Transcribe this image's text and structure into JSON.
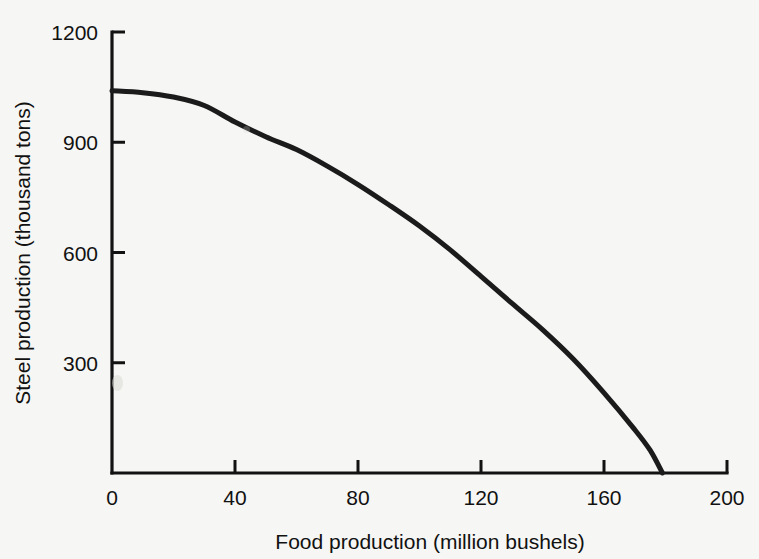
{
  "chart_data": {
    "type": "line",
    "title": "",
    "subtitle": "",
    "xlabel": "Food production (million bushels)",
    "ylabel": "Steel production (thousand tons)",
    "xlim": [
      0,
      200
    ],
    "ylim": [
      0,
      1200
    ],
    "xticks": [
      0,
      40,
      80,
      120,
      160,
      200
    ],
    "yticks": [
      0,
      300,
      600,
      900,
      1200
    ],
    "xtick_labels": [
      "0",
      "40",
      "80",
      "120",
      "160",
      "200"
    ],
    "ytick_labels": [
      "0",
      "300",
      "600",
      "900",
      "1200"
    ],
    "grid": false,
    "legend": "none",
    "series": [
      {
        "name": "Production possibilities frontier",
        "color": "#1b1b1b",
        "x": [
          0,
          10,
          20,
          30,
          40,
          50,
          60,
          70,
          80,
          90,
          100,
          110,
          120,
          130,
          140,
          150,
          160,
          170,
          175,
          179
        ],
        "y": [
          1040,
          1035,
          1023,
          1000,
          955,
          915,
          880,
          835,
          785,
          730,
          672,
          607,
          535,
          462,
          390,
          310,
          218,
          118,
          62,
          0
        ]
      }
    ],
    "annotations": []
  },
  "axes": {
    "x_axis_name": "x-axis",
    "y_axis_name": "y-axis",
    "tick_direction": "inward"
  },
  "colors": {
    "background": "#f6f6f4",
    "axis": "#121212",
    "curve": "#1b1b1b",
    "text": "#111111"
  }
}
